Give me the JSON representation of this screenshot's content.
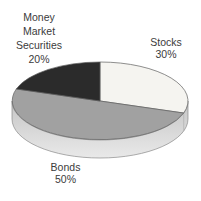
{
  "chart_data": {
    "type": "pie",
    "title": "",
    "effect": "3d-extruded",
    "start_angle_deg": 90,
    "direction": "clockwise",
    "categories": [
      "Stocks",
      "Bonds",
      "Money Market Securities"
    ],
    "values": [
      30,
      50,
      20
    ],
    "slices": [
      {
        "label": "Stocks",
        "pct": 30,
        "color": "#f5f4f0"
      },
      {
        "label": "Bonds",
        "pct": 50,
        "color": "#a1a1a1"
      },
      {
        "label": "Money Market Securities",
        "pct": 20,
        "color": "#2b2b2b"
      }
    ],
    "legend": "none",
    "labels_position": "outside"
  },
  "labels": {
    "money_market": {
      "lines": [
        "Money",
        "Market",
        "Securities"
      ],
      "pct": "20%"
    },
    "stocks": {
      "name": "Stocks",
      "pct": "30%"
    },
    "bonds": {
      "name": "Bonds",
      "pct": "50%"
    }
  },
  "colors": {
    "background": "#ffffff",
    "slice_edge": "#5f5f5f",
    "rim_edge": "#8a8a8a",
    "rim_gradient_top": "#c5c5c5",
    "rim_gradient_bottom": "#e9e9e9",
    "rim_divider": "#b0b0b0",
    "text": "#3b3b3b"
  }
}
